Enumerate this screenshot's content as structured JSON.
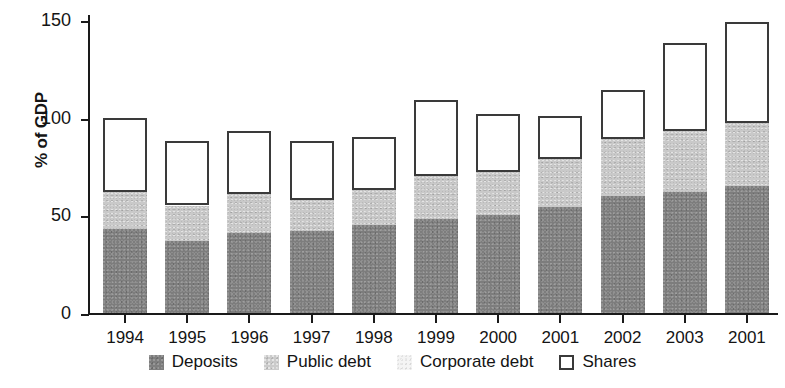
{
  "chart_data": {
    "type": "bar",
    "subtype": "stacked",
    "title": "",
    "xlabel": "",
    "ylabel": "% of GDP",
    "ylim": [
      0,
      155
    ],
    "yticks": [
      0,
      50,
      100,
      150
    ],
    "ytick_labels": [
      "0",
      "50",
      "100",
      "150"
    ],
    "grid": false,
    "legend_position": "bottom",
    "categories": [
      "1994",
      "1995",
      "1996",
      "1997",
      "1998",
      "1999",
      "2000",
      "2001",
      "2002",
      "2003",
      "2001"
    ],
    "series": [
      {
        "name": "Deposits",
        "color": "#7d7d7d",
        "values": [
          43,
          37,
          41,
          42,
          45,
          48,
          50,
          54,
          60,
          62,
          65
        ]
      },
      {
        "name": "Public debt",
        "color": "#c9c9c9",
        "values": [
          19,
          18,
          20,
          16,
          18,
          22,
          22,
          25,
          29,
          31,
          32
        ]
      },
      {
        "name": "Corporate debt",
        "color": "#fbfbfb",
        "values": [
          0,
          0,
          0,
          0,
          0,
          0,
          0,
          0,
          0,
          0,
          0
        ]
      },
      {
        "name": "Shares",
        "color": "#ffffff",
        "values": [
          38,
          33,
          32,
          30,
          27,
          39,
          30,
          22,
          25,
          45,
          52
        ]
      }
    ],
    "cumulative_tops": {
      "deposits": [
        43,
        37,
        41,
        42,
        45,
        48,
        50,
        54,
        60,
        62,
        65
      ],
      "public_debt": [
        62,
        55,
        61,
        58,
        63,
        70,
        72,
        79,
        89,
        93,
        97
      ],
      "corporate_debt": [
        62,
        55,
        61,
        58,
        63,
        70,
        72,
        79,
        89,
        93,
        97
      ],
      "shares": [
        100,
        88,
        93,
        88,
        90,
        109,
        102,
        101,
        114,
        138,
        149
      ]
    }
  },
  "legend": {
    "items": [
      {
        "label": "Deposits",
        "swatch": "swatch-deposits"
      },
      {
        "label": "Public debt",
        "swatch": "swatch-public"
      },
      {
        "label": "Corporate debt",
        "swatch": "swatch-corporate"
      },
      {
        "label": "Shares",
        "swatch": "swatch-shares"
      }
    ]
  }
}
